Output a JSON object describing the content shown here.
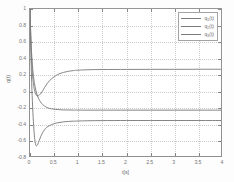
{
  "chart_data": {
    "type": "line",
    "title": "",
    "xlabel": "t[s]",
    "ylabel": "q(t)",
    "xlim": [
      0,
      4
    ],
    "ylim": [
      -0.8,
      1
    ],
    "xticks": [
      "0",
      "0.5",
      "1",
      "1.5",
      "2",
      "2.5",
      "3",
      "3.5",
      "4"
    ],
    "xtick_values": [
      0,
      0.5,
      1,
      1.5,
      2,
      2.5,
      3,
      3.5,
      4
    ],
    "yticks": [
      "1",
      "0.8",
      "0.6",
      "0.4",
      "0.2",
      "0",
      "-0.2",
      "-0.4",
      "-0.6",
      "-0.8"
    ],
    "ytick_values": [
      1,
      0.8,
      0.6,
      0.4,
      0.2,
      0,
      -0.2,
      -0.4,
      -0.6,
      -0.8
    ],
    "grid": true,
    "legend_position": "upper right",
    "series": [
      {
        "name": "q_1(t)",
        "label_base": "q",
        "label_sub": "1",
        "label_suffix": "(t)",
        "color": "#6e6e6e",
        "steady_state": 0.27,
        "x": [
          0,
          0.01,
          0.02,
          0.03,
          0.05,
          0.07,
          0.09,
          0.11,
          0.13,
          0.15,
          0.18,
          0.21,
          0.25,
          0.3,
          0.35,
          0.4,
          0.5,
          0.6,
          0.7,
          0.8,
          0.9,
          1.0,
          1.2,
          1.5,
          2.0,
          2.5,
          3.0,
          3.5,
          4.0
        ],
        "y": [
          1.0,
          0.78,
          0.58,
          0.42,
          0.22,
          0.1,
          0.03,
          -0.01,
          -0.04,
          -0.05,
          -0.045,
          -0.03,
          0.0,
          0.05,
          0.095,
          0.132,
          0.182,
          0.215,
          0.235,
          0.248,
          0.256,
          0.261,
          0.266,
          0.269,
          0.27,
          0.271,
          0.271,
          0.272,
          0.272
        ]
      },
      {
        "name": "q_2(t)",
        "label_base": "q",
        "label_sub": "2",
        "label_suffix": "(t)",
        "color": "#6e6e6e",
        "steady_state": -0.22,
        "x": [
          0,
          0.01,
          0.02,
          0.03,
          0.05,
          0.07,
          0.09,
          0.12,
          0.15,
          0.18,
          0.22,
          0.26,
          0.3,
          0.35,
          0.4,
          0.5,
          0.6,
          0.7,
          0.8,
          0.9,
          1.0,
          1.2,
          1.5,
          2.0,
          2.5,
          3.0,
          3.5,
          4.0
        ],
        "y": [
          1.0,
          0.8,
          0.63,
          0.5,
          0.32,
          0.2,
          0.11,
          0.02,
          -0.04,
          -0.085,
          -0.125,
          -0.153,
          -0.172,
          -0.19,
          -0.2,
          -0.211,
          -0.216,
          -0.219,
          -0.22,
          -0.221,
          -0.2215,
          -0.222,
          -0.222,
          -0.222,
          -0.222,
          -0.222,
          -0.222,
          -0.222
        ]
      },
      {
        "name": "q_3(t)",
        "label_base": "q",
        "label_sub": "3",
        "label_suffix": "(t)",
        "color": "#6e6e6e",
        "steady_state": -0.35,
        "undershoot": -0.65,
        "undershoot_time": 0.12,
        "x": [
          0,
          0.01,
          0.02,
          0.03,
          0.04,
          0.06,
          0.08,
          0.1,
          0.12,
          0.14,
          0.16,
          0.19,
          0.22,
          0.26,
          0.3,
          0.35,
          0.4,
          0.5,
          0.6,
          0.7,
          0.8,
          0.9,
          1.0,
          1.2,
          1.5,
          2.0,
          2.5,
          3.0,
          3.5,
          4.0
        ],
        "y": [
          1.0,
          0.7,
          0.42,
          0.2,
          0.02,
          -0.25,
          -0.45,
          -0.58,
          -0.645,
          -0.65,
          -0.635,
          -0.59,
          -0.545,
          -0.495,
          -0.46,
          -0.428,
          -0.41,
          -0.385,
          -0.372,
          -0.363,
          -0.358,
          -0.355,
          -0.353,
          -0.35,
          -0.348,
          -0.347,
          -0.347,
          -0.347,
          -0.347,
          -0.347
        ]
      }
    ]
  },
  "axes": {
    "xlabel": "t[s]",
    "ylabel": "q(t)"
  }
}
